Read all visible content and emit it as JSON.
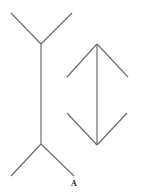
{
  "diagram": {
    "stroke_color": "#6e6e6e",
    "figure_left": {
      "shaft": [
        41,
        44,
        41,
        144
      ],
      "top_fins": [
        [
          11,
          13,
          41,
          44
        ],
        [
          72,
          13,
          41,
          44
        ]
      ],
      "bottom_fins": [
        [
          41,
          144,
          11,
          176
        ],
        [
          41,
          144,
          74,
          176
        ]
      ]
    },
    "figure_right": {
      "shaft": [
        97,
        44,
        97,
        145
      ],
      "top_fins": [
        [
          67,
          77,
          97,
          44
        ],
        [
          128,
          77,
          97,
          44
        ]
      ],
      "bottom_fins": [
        [
          67,
          113,
          97,
          145
        ],
        [
          127,
          113,
          97,
          145
        ]
      ]
    },
    "label": "A"
  }
}
